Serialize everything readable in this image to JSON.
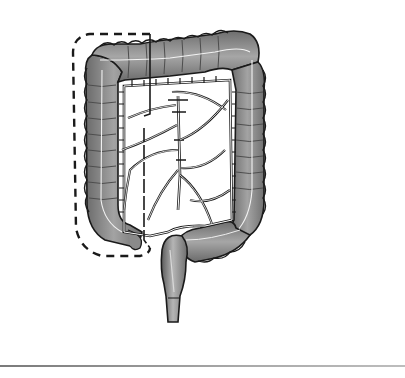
{
  "figure": {
    "style": "grayscale watercolor with ink outlines",
    "regions": [
      {
        "name": "ascending-colon",
        "highlighted": true
      },
      {
        "name": "transverse-colon",
        "highlighted": false
      },
      {
        "name": "descending-colon",
        "highlighted": false
      },
      {
        "name": "sigmoid-colon",
        "highlighted": false
      },
      {
        "name": "rectum",
        "highlighted": false
      },
      {
        "name": "mesenteric-vessels",
        "highlighted": false
      }
    ],
    "annotation": {
      "type": "dashed-outline",
      "target": "right colon / ascending colon",
      "cut_line": "solid vertical line"
    }
  },
  "colors": {
    "background": "#ffffff",
    "colon_fill": "#8c8c8c",
    "colon_dark": "#5e5e5e",
    "outline": "#1a1a1a",
    "rule": "#9a9a9a"
  }
}
